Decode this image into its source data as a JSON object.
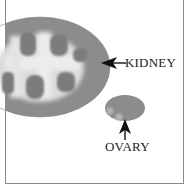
{
  "diagram": {
    "labels": {
      "kidney": "KIDNEY",
      "ovary": "OVARY"
    },
    "colors": {
      "background": "#ffffff",
      "frame": "#8a8a8a",
      "organ_fill": "#8c8c8c",
      "lobule_dark": "#7a7a7a",
      "lobule_light": "#e8e8e8",
      "arrow": "#111111",
      "text": "#222222"
    }
  }
}
